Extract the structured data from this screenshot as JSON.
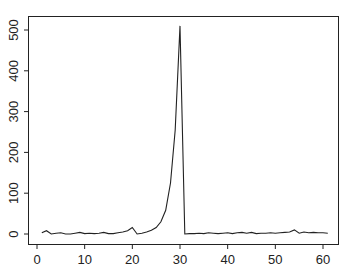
{
  "chart_data": {
    "type": "line",
    "title": "",
    "xlabel": "",
    "ylabel": "",
    "xlim": [
      -1,
      62
    ],
    "ylim": [
      -20,
      525
    ],
    "xticks": [
      0,
      10,
      20,
      30,
      40,
      50,
      60
    ],
    "yticks": [
      0,
      100,
      200,
      300,
      400,
      500
    ],
    "grid": false,
    "legend": null,
    "series": [
      {
        "name": "series",
        "color": "#222222",
        "x": [
          1,
          2,
          3,
          4,
          5,
          6,
          7,
          8,
          9,
          10,
          11,
          12,
          13,
          14,
          15,
          16,
          17,
          18,
          19,
          20,
          21,
          22,
          23,
          24,
          25,
          26,
          27,
          28,
          29,
          30,
          31,
          32,
          33,
          34,
          35,
          36,
          37,
          38,
          39,
          40,
          41,
          42,
          43,
          44,
          45,
          46,
          47,
          48,
          49,
          50,
          51,
          52,
          53,
          54,
          55,
          56,
          57,
          58,
          59,
          60,
          61
        ],
        "y": [
          3,
          8,
          0,
          2,
          3,
          0,
          0,
          2,
          4,
          1,
          2,
          1,
          2,
          4,
          1,
          1,
          3,
          5,
          8,
          16,
          0,
          2,
          5,
          9,
          16,
          30,
          58,
          125,
          255,
          510,
          0,
          1,
          1,
          2,
          1,
          3,
          2,
          1,
          2,
          3,
          1,
          3,
          4,
          2,
          4,
          1,
          2,
          2,
          3,
          2,
          3,
          4,
          5,
          10,
          2,
          5,
          3,
          4,
          3,
          3,
          2
        ]
      }
    ]
  }
}
